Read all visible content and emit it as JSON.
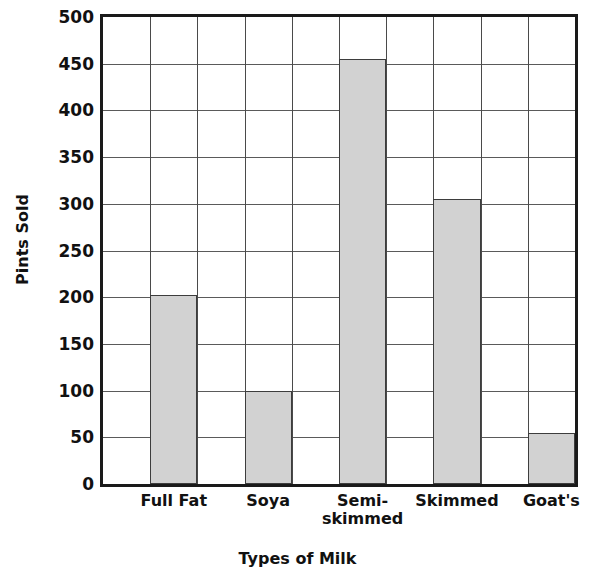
{
  "chart_data": {
    "type": "bar",
    "title": "",
    "xlabel": "Types of Milk",
    "ylabel": "Pints Sold",
    "categories": [
      "Full Fat",
      "Soya",
      "Semi-\nskimmed",
      "Skimmed",
      "Goat's"
    ],
    "category_lines": [
      [
        "Full Fat"
      ],
      [
        "Soya"
      ],
      [
        "Semi-",
        "skimmed"
      ],
      [
        "Skimmed"
      ],
      [
        "Goat's"
      ]
    ],
    "values": [
      202,
      100,
      455,
      305,
      55
    ],
    "ylim": [
      0,
      500
    ],
    "ytick_step": 50,
    "yticks": [
      0,
      50,
      100,
      150,
      200,
      250,
      300,
      350,
      400,
      450,
      500
    ],
    "ytick_labels": [
      "0",
      "50",
      "100",
      "150",
      "200",
      "250",
      "300",
      "350",
      "400",
      "450",
      "500"
    ],
    "grid": true,
    "grid_columns": 10,
    "bar_columns": [
      2,
      4,
      6,
      8,
      10
    ],
    "legend": null,
    "bar_color": "#d2d2d2",
    "bar_edge_color": "#3d3d3d",
    "axis_color": "#1a1a1a",
    "grid_color": "#5a5a5a"
  }
}
